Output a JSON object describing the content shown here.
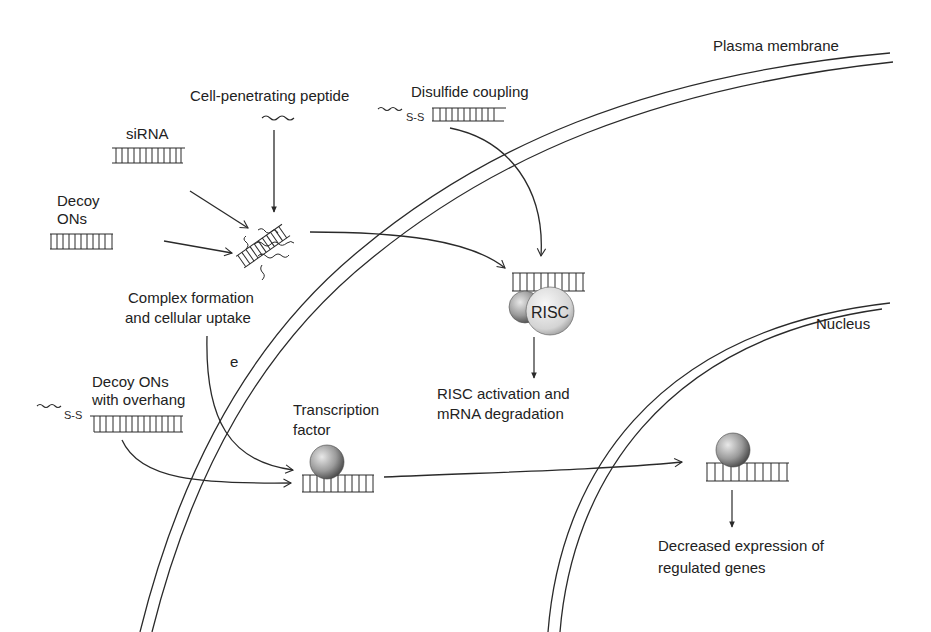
{
  "colors": {
    "ink": "#2a2a2a",
    "background": "#ffffff",
    "sphere_light": "#e6e6e6",
    "sphere_dark": "#5a5a5a"
  },
  "labels": {
    "plasma_membrane": "Plasma membrane",
    "nucleus": "Nucleus",
    "cell_penetrating_peptide": "Cell-penetrating peptide",
    "disulfide_coupling": "Disulfide coupling",
    "sirna": "siRNA",
    "decoy_ons_line1": "Decoy",
    "decoy_ons_line2": "ONs",
    "complex_line1": "Complex formation",
    "complex_line2": "and cellular uptake",
    "endosome_marker": "e",
    "decoy_overhang_line1": "Decoy ONs",
    "decoy_overhang_line2": "with overhang",
    "transcription_factor_line1": "Transcription",
    "transcription_factor_line2": "factor",
    "risc": "RISC",
    "risc_activation_line1": "RISC activation and",
    "risc_activation_line2": "mRNA degradation",
    "decreased_line1": "Decreased expression of",
    "decreased_line2": "regulated genes",
    "disulfide_bond": "S-S"
  },
  "icons": {
    "duplex": "ladder-duplex-icon",
    "peptide": "wavy-peptide-icon",
    "protein": "shaded-sphere-icon"
  }
}
